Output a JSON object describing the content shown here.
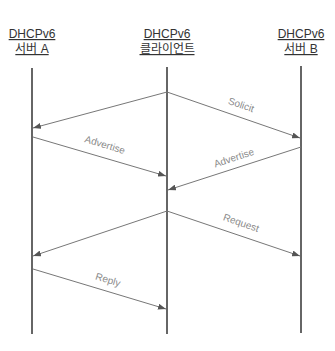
{
  "diagram": {
    "type": "sequence",
    "participants": [
      {
        "id": "A",
        "line1": "DHCPv6",
        "line2": "서버 A",
        "x": 32
      },
      {
        "id": "C",
        "line1": "DHCPv6",
        "line2": "클라이언트",
        "x": 167
      },
      {
        "id": "B",
        "line1": "DHCPv6",
        "line2": "서버 B",
        "x": 301
      }
    ],
    "messages": [
      {
        "label": "Solicit",
        "from": "C",
        "to": "B"
      },
      {
        "label": "",
        "from": "C",
        "to": "A"
      },
      {
        "label": "Advertise",
        "from": "A",
        "to": "C"
      },
      {
        "label": "Advertise",
        "from": "B",
        "to": "C"
      },
      {
        "label": "Request",
        "from": "C",
        "to": "B"
      },
      {
        "label": "",
        "from": "C",
        "to": "A"
      },
      {
        "label": "Reply",
        "from": "A",
        "to": "C"
      }
    ],
    "colors": {
      "lifeline": "#333333",
      "arrow": "#666666",
      "label": "#8a8a8a"
    }
  }
}
